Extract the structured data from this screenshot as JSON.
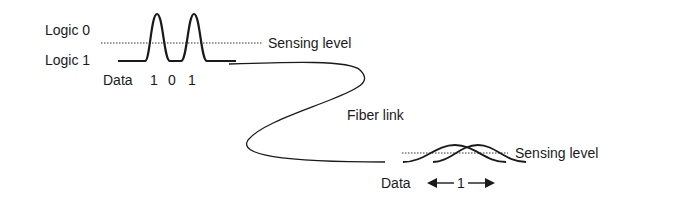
{
  "diagram": {
    "transmitter": {
      "logic_top_label": "Logic 0",
      "logic_bottom_label": "Logic 1",
      "sensing_level_label": "Sensing level",
      "data_label": "Data",
      "bits": [
        "1",
        "0",
        "1"
      ]
    },
    "link": {
      "label": "Fiber link"
    },
    "receiver": {
      "sensing_level_label": "Sensing level",
      "data_label": "Data",
      "bit_span_label": "1"
    },
    "colors": {
      "ink": "#1a1a1a",
      "background": "#ffffff"
    }
  }
}
